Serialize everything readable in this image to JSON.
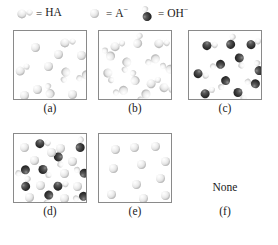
{
  "figure": {
    "type": "molecular-representation-multiple-choice",
    "width": 278,
    "height": 245
  },
  "legend": {
    "items": [
      {
        "icon": "ha-molecule-icon",
        "equals": "=",
        "label": "HA",
        "charge": "",
        "x": 18
      },
      {
        "icon": "a-minus-sphere-icon",
        "equals": "=",
        "label": "A",
        "charge": "−",
        "x": 88
      },
      {
        "icon": "oh-minus-molecule-icon",
        "equals": "=",
        "label": "OH",
        "charge": "−",
        "x": 140
      }
    ]
  },
  "colors": {
    "light_sphere": "#e2e2e2",
    "dark_sphere": "#2a2a2a",
    "box_border": "#8a8a8a",
    "background": "#ffffff",
    "text": "#1a1a1a"
  },
  "panels": [
    {
      "id": "a",
      "label": "(a)",
      "box": {
        "x": 13,
        "y": 30,
        "w": 74,
        "h": 70
      },
      "label_y": 102,
      "description": "mixture of HA molecules and A- spheres, all light colored",
      "counts": {
        "HA": 5,
        "A-": 7,
        "OH-": 0
      },
      "particles": [
        {
          "type": "A-",
          "x": 15,
          "y": 10
        },
        {
          "type": "HA",
          "x": 47,
          "y": 5,
          "rot": 35
        },
        {
          "type": "A-",
          "x": 61,
          "y": 18
        },
        {
          "type": "HA",
          "x": 2,
          "y": 32,
          "rot": 10
        },
        {
          "type": "A-",
          "x": 28,
          "y": 29
        },
        {
          "type": "HA",
          "x": 44,
          "y": 37,
          "rot": 150
        },
        {
          "type": "HA",
          "x": 63,
          "y": 38,
          "rot": 200
        },
        {
          "type": "A-",
          "x": 17,
          "y": 52
        },
        {
          "type": "HA",
          "x": 29,
          "y": 53,
          "rot": 300
        },
        {
          "type": "A-",
          "x": 52,
          "y": 57
        },
        {
          "type": "A-",
          "x": 4,
          "y": 58
        },
        {
          "type": "A-",
          "x": 38,
          "y": 17
        }
      ]
    },
    {
      "id": "b",
      "label": "(b)",
      "box": {
        "x": 98,
        "y": 30,
        "w": 74,
        "h": 70
      },
      "label_y": 102,
      "description": "all HA molecules, no ions present",
      "counts": {
        "HA": 13,
        "A-": 0,
        "OH-": 0
      },
      "particles": [
        {
          "type": "HA",
          "x": 12,
          "y": 8,
          "rot": 20
        },
        {
          "type": "HA",
          "x": 33,
          "y": 3,
          "rot": 330
        },
        {
          "type": "HA",
          "x": 56,
          "y": 6,
          "rot": 40
        },
        {
          "type": "HA",
          "x": 47,
          "y": 22,
          "rot": 200
        },
        {
          "type": "HA",
          "x": 20,
          "y": 27,
          "rot": 150
        },
        {
          "type": "HA",
          "x": 62,
          "y": 30,
          "rot": 250
        },
        {
          "type": "HA",
          "x": 3,
          "y": 38,
          "rot": 110
        },
        {
          "type": "HA",
          "x": 29,
          "y": 40,
          "rot": 300
        },
        {
          "type": "HA",
          "x": 48,
          "y": 45,
          "rot": 15
        },
        {
          "type": "HA",
          "x": 15,
          "y": 53,
          "rot": 210
        },
        {
          "type": "HA",
          "x": 61,
          "y": 51,
          "rot": 60
        },
        {
          "type": "HA",
          "x": 38,
          "y": 58,
          "rot": 180
        },
        {
          "type": "HA",
          "x": 3,
          "y": 16,
          "rot": 270
        }
      ]
    },
    {
      "id": "c",
      "label": "(c)",
      "box": {
        "x": 188,
        "y": 30,
        "w": 74,
        "h": 70
      },
      "label_y": 102,
      "description": "all OH- hydroxide ions, dark spheres with small white lobes",
      "counts": {
        "HA": 0,
        "A-": 0,
        "OH-": 11
      },
      "particles": [
        {
          "type": "OH-",
          "x": 14,
          "y": 8,
          "rot": 40
        },
        {
          "type": "OH-",
          "x": 36,
          "y": 4,
          "rot": 330
        },
        {
          "type": "OH-",
          "x": 58,
          "y": 6,
          "rot": 20
        },
        {
          "type": "OH-",
          "x": 44,
          "y": 23,
          "rot": 120
        },
        {
          "type": "OH-",
          "x": 22,
          "y": 27,
          "rot": 210
        },
        {
          "type": "OH-",
          "x": 63,
          "y": 30,
          "rot": 300
        },
        {
          "type": "OH-",
          "x": 5,
          "y": 37,
          "rot": 60
        },
        {
          "type": "OH-",
          "x": 28,
          "y": 45,
          "rot": 170
        },
        {
          "type": "OH-",
          "x": 57,
          "y": 45,
          "rot": 240
        },
        {
          "type": "OH-",
          "x": 44,
          "y": 57,
          "rot": 90
        },
        {
          "type": "OH-",
          "x": 12,
          "y": 55,
          "rot": 15
        }
      ]
    },
    {
      "id": "d",
      "label": "(d)",
      "box": {
        "x": 13,
        "y": 133,
        "w": 74,
        "h": 70
      },
      "label_y": 205,
      "description": "mixture of dark OH- ions and light A- spheres",
      "counts": {
        "HA": 0,
        "A-": 11,
        "OH-": 10
      },
      "particles": [
        {
          "type": "A-",
          "x": 4,
          "y": 7
        },
        {
          "type": "OH-",
          "x": 22,
          "y": 3,
          "rot": 40
        },
        {
          "type": "A-",
          "x": 40,
          "y": 8
        },
        {
          "type": "OH-",
          "x": 60,
          "y": 4,
          "rot": 320
        },
        {
          "type": "A-",
          "x": 14,
          "y": 20
        },
        {
          "type": "OH-",
          "x": 38,
          "y": 19,
          "rot": 120
        },
        {
          "type": "A-",
          "x": 52,
          "y": 21
        },
        {
          "type": "OH-",
          "x": 2,
          "y": 30,
          "rot": 200
        },
        {
          "type": "OH-",
          "x": 24,
          "y": 31,
          "rot": 90
        },
        {
          "type": "A-",
          "x": 44,
          "y": 33
        },
        {
          "type": "OH-",
          "x": 61,
          "y": 31,
          "rot": 250
        },
        {
          "type": "OH-",
          "x": 6,
          "y": 43,
          "rot": 330
        },
        {
          "type": "A-",
          "x": 20,
          "y": 45
        },
        {
          "type": "OH-",
          "x": 40,
          "y": 45,
          "rot": 30
        },
        {
          "type": "A-",
          "x": 57,
          "y": 46
        },
        {
          "type": "A-",
          "x": 9,
          "y": 57
        },
        {
          "type": "OH-",
          "x": 27,
          "y": 57,
          "rot": 150
        },
        {
          "type": "A-",
          "x": 44,
          "y": 58
        },
        {
          "type": "OH-",
          "x": 60,
          "y": 56,
          "rot": 210
        },
        {
          "type": "A-",
          "x": 31,
          "y": 12
        }
      ]
    },
    {
      "id": "e",
      "label": "(e)",
      "box": {
        "x": 98,
        "y": 133,
        "w": 74,
        "h": 70
      },
      "label_y": 205,
      "description": "only A- spheres, loosely spaced",
      "counts": {
        "HA": 0,
        "A-": 11,
        "OH-": 0
      },
      "particles": [
        {
          "type": "A-",
          "x": 10,
          "y": 9
        },
        {
          "type": "A-",
          "x": 29,
          "y": 7
        },
        {
          "type": "A-",
          "x": 50,
          "y": 6
        },
        {
          "type": "A-",
          "x": 36,
          "y": 24
        },
        {
          "type": "A-",
          "x": 60,
          "y": 21
        },
        {
          "type": "A-",
          "x": 8,
          "y": 28
        },
        {
          "type": "A-",
          "x": 55,
          "y": 38
        },
        {
          "type": "A-",
          "x": 31,
          "y": 44
        },
        {
          "type": "A-",
          "x": 6,
          "y": 54
        },
        {
          "type": "A-",
          "x": 60,
          "y": 55
        },
        {
          "type": "A-",
          "x": 38,
          "y": 58
        }
      ]
    },
    {
      "id": "f",
      "label": "(f)",
      "box": null,
      "none_text": "None",
      "none_x": 188,
      "none_y": 181,
      "none_w": 74,
      "label_y": 205,
      "description": "no diagram, answer option reading None",
      "counts": {
        "HA": 0,
        "A-": 0,
        "OH-": 0
      },
      "particles": []
    }
  ]
}
